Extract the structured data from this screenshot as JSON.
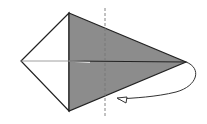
{
  "diagram": {
    "type": "origami-fold-step",
    "colors": {
      "paper_front": "#ffffff",
      "paper_back": "#8c8c8c",
      "line": "#222222",
      "background": "#ffffff"
    },
    "shapes": {
      "white_left_kite": "21,61 69,13 69,111",
      "gray_right_half": "69,13 186,62 69,111"
    },
    "fold_line": {
      "style": "valley-dashed",
      "x": 105
    },
    "arrow": {
      "direction": "fold-behind",
      "label": ""
    }
  }
}
